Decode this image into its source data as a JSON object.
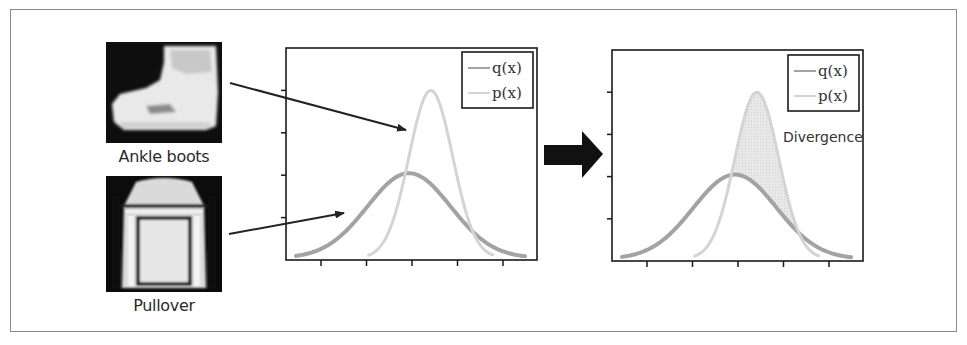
{
  "figure": {
    "images": [
      {
        "label": "Ankle boots",
        "kind": "ankle-boot-thumbnail"
      },
      {
        "label": "Pullover",
        "kind": "pullover-thumbnail"
      }
    ],
    "transition_arrow": "right-arrow",
    "divergence_label": "Divergence"
  },
  "chart_data": [
    {
      "type": "line",
      "title": "",
      "xlabel": "",
      "ylabel": "",
      "x_ticks": 5,
      "y_ticks": 4,
      "tick_labels": false,
      "grid": false,
      "legend_position": "upper right",
      "series": [
        {
          "name": "q(x)",
          "shape": "gaussian",
          "center_rel": 0.49,
          "peak_rel": 0.4,
          "sigma_rel": 0.166,
          "color": "#a3a3a3",
          "width": 4
        },
        {
          "name": "p(x)",
          "shape": "gaussian",
          "center_rel": 0.577,
          "peak_rel": 0.79,
          "sigma_rel": 0.087,
          "color": "#d4d4d4",
          "width": 3
        }
      ],
      "annotations": []
    },
    {
      "type": "area",
      "title": "",
      "xlabel": "",
      "ylabel": "",
      "x_ticks": 5,
      "y_ticks": 4,
      "tick_labels": false,
      "grid": false,
      "legend_position": "upper right",
      "series": [
        {
          "name": "q(x)",
          "shape": "gaussian",
          "center_rel": 0.49,
          "peak_rel": 0.4,
          "sigma_rel": 0.166,
          "color": "#a3a3a3",
          "width": 4
        },
        {
          "name": "p(x)",
          "shape": "gaussian",
          "center_rel": 0.577,
          "peak_rel": 0.79,
          "sigma_rel": 0.087,
          "color": "#d4d4d4",
          "width": 3
        }
      ],
      "shaded_region": {
        "between": [
          "p(x)",
          "q(x)"
        ],
        "where": "p > q",
        "color": "#e4e4e4",
        "label": "Divergence"
      },
      "annotations": [
        "Divergence"
      ]
    }
  ],
  "legend": {
    "q_label": "q(x)",
    "p_label": "p(x)"
  }
}
